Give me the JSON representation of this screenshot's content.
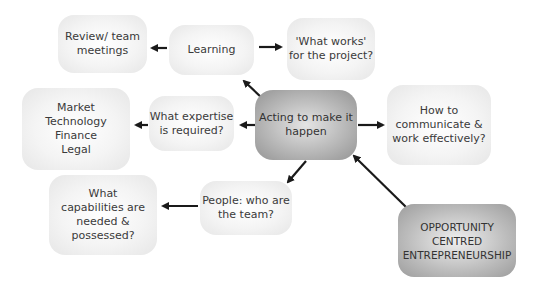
{
  "diagram": {
    "nodes": {
      "review": "Review/ team\nmeetings",
      "learning": "Learning",
      "what_works": "'What works'\nfor the project?",
      "market": "Market\nTechnology\nFinance\nLegal",
      "expertise": "What expertise\nis required?",
      "acting": "Acting to make it\nhappen",
      "communicate": "How to\ncommunicate &\nwork effectively?",
      "capabilities": "What\ncapabilities are\nneeded &\npossessed?",
      "people": "People: who are\nthe team?",
      "opportunity": "OPPORTUNITY\nCENTRED\nENTREPRENEURSHIP"
    },
    "edges": [
      {
        "from": "opportunity",
        "to": "acting"
      },
      {
        "from": "acting",
        "to": "learning"
      },
      {
        "from": "acting",
        "to": "expertise"
      },
      {
        "from": "acting",
        "to": "communicate"
      },
      {
        "from": "acting",
        "to": "people"
      },
      {
        "from": "learning",
        "to": "review"
      },
      {
        "from": "learning",
        "to": "what_works"
      },
      {
        "from": "expertise",
        "to": "market"
      },
      {
        "from": "people",
        "to": "capabilities"
      }
    ],
    "colors": {
      "arrow": "#1a1a1a",
      "light_node": "#f0f0f0",
      "dark_node": "#a8a8a8",
      "text": "#3a3a3a"
    }
  }
}
